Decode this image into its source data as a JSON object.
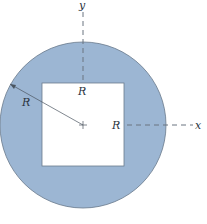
{
  "diagram": {
    "type": "cross-section",
    "labels": {
      "y_axis": "y",
      "x_axis": "x",
      "radius": "R",
      "top_half_side": "R",
      "right_half_side": "R"
    },
    "colors": {
      "fill": "#9cb6d3",
      "outline": "#6a7a8c",
      "hole": "#ffffff",
      "axis": "#6b7480"
    }
  }
}
